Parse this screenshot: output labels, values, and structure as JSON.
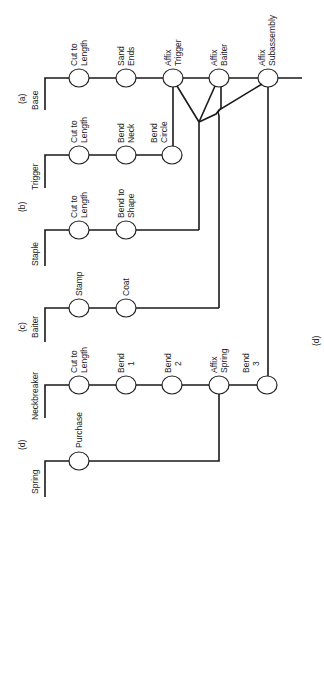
{
  "diagram": {
    "type": "operations process chart (rotated)",
    "stroke_color": "#1a1a1a",
    "background": "#ffffff",
    "figure_label": "(d)",
    "rows": [
      {
        "tag": "(a)",
        "part": "Base",
        "operations": [
          "Cut to Length",
          "Sand Ends",
          "Affix Trigger",
          "Affix Baiter",
          "Affix Subassembly"
        ]
      },
      {
        "tag": "",
        "part": "Trigger",
        "operations": [
          "Cut to Length",
          "Bend Neck",
          "Bend Circle"
        ]
      },
      {
        "tag": "(b)",
        "part": "Staple",
        "operations": [
          "Cut to Length",
          "Bend to Shape"
        ]
      },
      {
        "tag": "(c)",
        "part": "Baiter",
        "operations": [
          "Stamp",
          "Coat"
        ]
      },
      {
        "tag": "",
        "part": "Neckbreaker",
        "operations": [
          "Cut to Length",
          "Bend 1",
          "Bend 2",
          "Affix Spring",
          "Bend 3"
        ]
      },
      {
        "tag": "(d)",
        "part": "Spring",
        "operations": [
          "Purchase"
        ]
      }
    ],
    "labels": {
      "base_tag": "(a)",
      "base": "Base",
      "base_op1_l1": "Cut to",
      "base_op1_l2": "Length",
      "base_op2_l1": "Sand",
      "base_op2_l2": "Ends",
      "base_op3_l1": "Affix",
      "base_op3_l2": "Trigger",
      "base_op4_l1": "Affix",
      "base_op4_l2": "Baiter",
      "base_op5_l1": "Affix",
      "base_op5_l2": "Subassembly",
      "trigger": "Trigger",
      "trigger_op1_l1": "Cut to",
      "trigger_op1_l2": "Length",
      "trigger_op2_l1": "Bend",
      "trigger_op2_l2": "Neck",
      "trigger_op3_l1": "Bend",
      "trigger_op3_l2": "Circle",
      "staple_tag": "(b)",
      "staple": "Staple",
      "staple_op1_l1": "Cut to",
      "staple_op1_l2": "Length",
      "staple_op2_l1": "Bend to",
      "staple_op2_l2": "Shape",
      "baiter_tag": "(c)",
      "baiter": "Baiter",
      "baiter_op1": "Stamp",
      "baiter_op2": "Coat",
      "neck": "Neckbreaker",
      "neck_op1_l1": "Cut to",
      "neck_op1_l2": "Length",
      "neck_op2_l1": "Bend",
      "neck_op2_l2": "1",
      "neck_op3_l1": "Bend",
      "neck_op3_l2": "2",
      "neck_op4_l1": "Affix",
      "neck_op4_l2": "Spring",
      "neck_op5_l1": "Bend",
      "neck_op5_l2": "3",
      "spring_tag": "(d)",
      "spring": "Spring",
      "spring_op1": "Purchase",
      "figure_label": "(d)"
    }
  }
}
